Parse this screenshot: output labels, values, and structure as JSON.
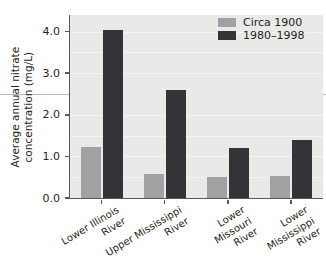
{
  "chart_data": {
    "type": "bar",
    "title": "",
    "xlabel": "",
    "ylabel": "Average annual nitrate concentration (mg/L)",
    "ylabel_line1": "Average annual nitrate",
    "ylabel_line2": "concentration (mg/L)",
    "categories": [
      "Lower Illinois River",
      "Upper Mississippi River",
      "Lower Missouri River",
      "Lower Mississippi River"
    ],
    "category_lines": [
      [
        "Lower Illinois",
        "River"
      ],
      [
        "Upper Mississippi",
        "River"
      ],
      [
        "Lower",
        "Missouri",
        "River"
      ],
      [
        "Lower",
        "Mississippi",
        "River"
      ]
    ],
    "series": [
      {
        "name": "Circa 1900",
        "color": "#a0a1a2",
        "values": [
          1.23,
          0.57,
          0.5,
          0.53
        ]
      },
      {
        "name": "1980–1998",
        "color": "#333338",
        "values": [
          4.05,
          2.6,
          1.2,
          1.4
        ]
      }
    ],
    "ylim": [
      0.0,
      4.4
    ],
    "yticks": [
      0.0,
      1.0,
      2.0,
      3.0,
      4.0
    ],
    "ytick_labels": [
      "0.0",
      "1.0",
      "2.0",
      "3.0",
      "4.0"
    ],
    "gridlines": [
      0.5,
      1.0,
      1.5,
      2.0,
      2.5,
      3.0,
      3.5,
      4.0
    ],
    "reference_line": 2.5,
    "grid": true,
    "legend_position": "top-right",
    "plot_background": "#e9e9e7",
    "axis_color": "#58595b",
    "rule_color": "#b9bbbd"
  },
  "legend": {
    "items": [
      {
        "label": "Circa 1900"
      },
      {
        "label": "1980–1998"
      }
    ]
  }
}
